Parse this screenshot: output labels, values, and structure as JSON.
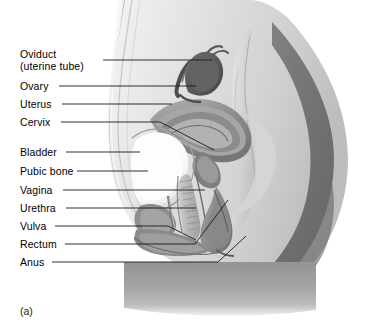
{
  "figure": {
    "caption": "(a)",
    "type": "anatomical-illustration",
    "style": "grayscale",
    "colors": {
      "background": "#ffffff",
      "leader_line": "#1a1a1a",
      "text": "#000000",
      "body_light": "#e8e8e8",
      "body_mid": "#b8b8b8",
      "body_dark": "#7a7a7a",
      "buttock_dark": "#6f6f6f",
      "bladder_light": "#fbfbfb",
      "uterus_mid": "#9a9a9a",
      "ovary_dark": "#5c5c5c"
    },
    "labels": [
      {
        "id": "oviduct",
        "line1": "Oviduct",
        "line2": "(uterine tube)",
        "text_x": 20,
        "text_y": 48,
        "leader_x1": 103,
        "leader_y1": 60,
        "leader_x2": 212,
        "leader_y2": 60
      },
      {
        "id": "ovary",
        "line1": "Ovary",
        "line2": "",
        "text_x": 20,
        "text_y": 80,
        "leader_x1": 59,
        "leader_y1": 86,
        "leader_x2": 196,
        "leader_y2": 86
      },
      {
        "id": "uterus",
        "line1": "Uterus",
        "line2": "",
        "text_x": 20,
        "text_y": 98,
        "leader_x1": 62,
        "leader_y1": 104,
        "leader_x2": 172,
        "leader_y2": 104
      },
      {
        "id": "cervix",
        "line1": "Cervix",
        "line2": "",
        "text_x": 20,
        "text_y": 116,
        "leader_x1": 61,
        "leader_y1": 122,
        "leader_x2": 160,
        "leader_y2": 122
      },
      {
        "id": "bladder",
        "line1": "Bladder",
        "line2": "",
        "text_x": 20,
        "text_y": 146,
        "leader_x1": 66,
        "leader_y1": 152,
        "leader_x2": 140,
        "leader_y2": 152
      },
      {
        "id": "pubic-bone",
        "line1": "Pubic bone",
        "line2": "",
        "text_x": 20,
        "text_y": 165,
        "leader_x1": 77,
        "leader_y1": 171,
        "leader_x2": 148,
        "leader_y2": 171
      },
      {
        "id": "vagina",
        "line1": "Vagina",
        "line2": "",
        "text_x": 20,
        "text_y": 184,
        "leader_x1": 63,
        "leader_y1": 190,
        "leader_x2": 205,
        "leader_y2": 190
      },
      {
        "id": "urethra",
        "line1": "Urethra",
        "line2": "",
        "text_x": 20,
        "text_y": 202,
        "leader_x1": 66,
        "leader_y1": 208,
        "leader_x2": 196,
        "leader_y2": 208
      },
      {
        "id": "vulva",
        "line1": "Vulva",
        "line2": "",
        "text_x": 20,
        "text_y": 220,
        "leader_x1": 55,
        "leader_y1": 226,
        "leader_x2": 168,
        "leader_y2": 226
      },
      {
        "id": "rectum",
        "line1": "Rectum",
        "line2": "",
        "text_x": 20,
        "text_y": 238,
        "leader_x1": 65,
        "leader_y1": 244,
        "leader_x2": 195,
        "leader_y2": 244
      },
      {
        "id": "anus",
        "line1": "Anus",
        "line2": "",
        "text_x": 20,
        "text_y": 256,
        "leader_x1": 52,
        "leader_y1": 262,
        "leader_x2": 218,
        "leader_y2": 262
      }
    ]
  }
}
